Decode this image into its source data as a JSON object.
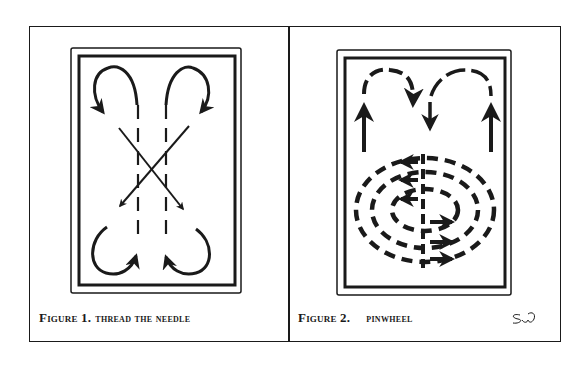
{
  "figures": [
    {
      "label": "Figure 1.",
      "title": "THREAD THE NEEDLE",
      "diagram": "four curved arrows at corners, two crossing diagonal arrows, two center dashed lines"
    },
    {
      "label": "Figure 2.",
      "title": "PINWHEEL",
      "diagram": "two dashed arched arrows on top, three concentric dashed ellipses with arrows, center dashed line",
      "signature": "SW"
    }
  ],
  "colors": {
    "ink": "#1a1a1a",
    "paper": "#ffffff"
  }
}
